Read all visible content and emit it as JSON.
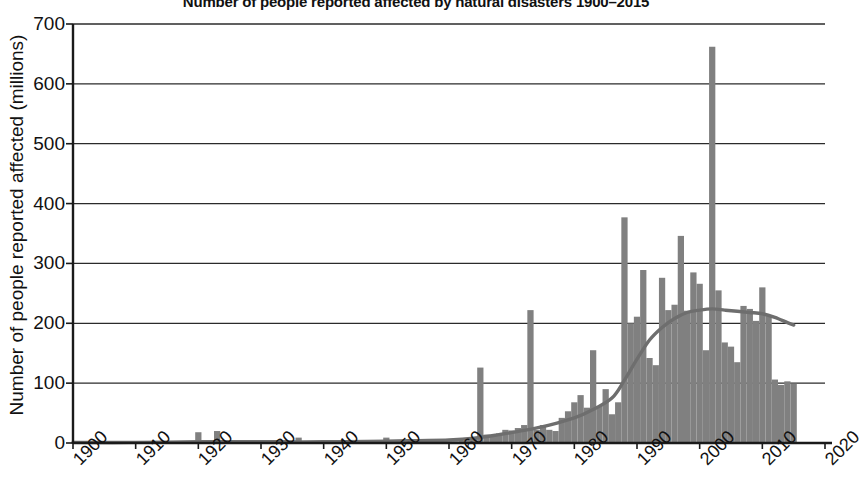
{
  "chart_data": {
    "type": "bar",
    "title": "Number of people reported affected by natural disasters 1900–2015",
    "xlabel": "",
    "ylabel": "Number of people reported affected (millions)",
    "xlim": [
      1900,
      2020
    ],
    "ylim": [
      0,
      700
    ],
    "ytick_labels": [
      "0",
      "100",
      "200",
      "300",
      "400",
      "500",
      "600",
      "700"
    ],
    "yticks": [
      0,
      100,
      200,
      300,
      400,
      500,
      600,
      700
    ],
    "xtick_labels": [
      "1900",
      "1910",
      "1920",
      "1930",
      "1940",
      "1950",
      "1960",
      "1970",
      "1980",
      "1990",
      "2000",
      "2010",
      "2020"
    ],
    "xticks": [
      1900,
      1910,
      1920,
      1930,
      1940,
      1950,
      1960,
      1970,
      1980,
      1990,
      2000,
      2010,
      2020
    ],
    "grid": "horizontal",
    "legend": "none",
    "bar_color": "#808080",
    "trend_color": "#6e6e6e",
    "axis_color": "#1a1a1a",
    "series": [
      {
        "name": "People reported affected (millions)",
        "type": "bar",
        "x": [
          1900,
          1901,
          1902,
          1903,
          1904,
          1905,
          1906,
          1907,
          1908,
          1909,
          1910,
          1911,
          1912,
          1913,
          1914,
          1915,
          1916,
          1917,
          1918,
          1919,
          1920,
          1921,
          1922,
          1923,
          1924,
          1925,
          1926,
          1927,
          1928,
          1929,
          1930,
          1931,
          1932,
          1933,
          1934,
          1935,
          1936,
          1937,
          1938,
          1939,
          1940,
          1941,
          1942,
          1943,
          1944,
          1945,
          1946,
          1947,
          1948,
          1949,
          1950,
          1951,
          1952,
          1953,
          1954,
          1955,
          1956,
          1957,
          1958,
          1959,
          1960,
          1961,
          1962,
          1963,
          1964,
          1965,
          1966,
          1967,
          1968,
          1969,
          1970,
          1971,
          1972,
          1973,
          1974,
          1975,
          1976,
          1977,
          1978,
          1979,
          1980,
          1981,
          1982,
          1983,
          1984,
          1985,
          1986,
          1987,
          1988,
          1989,
          1990,
          1991,
          1992,
          1993,
          1994,
          1995,
          1996,
          1997,
          1998,
          1999,
          2000,
          2001,
          2002,
          2003,
          2004,
          2005,
          2006,
          2007,
          2008,
          2009,
          2010,
          2011,
          2012,
          2013,
          2014,
          2015
        ],
        "values": [
          0,
          0,
          0,
          0,
          0,
          0,
          0,
          0,
          0,
          0,
          0,
          0,
          0,
          0,
          0,
          0,
          0,
          0,
          0,
          0,
          18,
          0,
          0,
          20,
          0,
          0,
          0,
          0,
          0,
          0,
          0,
          0,
          0,
          0,
          0,
          0,
          9,
          0,
          0,
          0,
          0,
          0,
          0,
          0,
          0,
          0,
          0,
          0,
          0,
          0,
          9,
          0,
          0,
          0,
          0,
          0,
          0,
          0,
          0,
          0,
          3,
          3,
          4,
          6,
          10,
          126,
          14,
          13,
          16,
          22,
          21,
          25,
          30,
          222,
          22,
          30,
          22,
          20,
          42,
          53,
          68,
          80,
          59,
          155,
          62,
          90,
          48,
          68,
          377,
          200,
          211,
          289,
          142,
          130,
          276,
          222,
          231,
          346,
          221,
          285,
          266,
          155,
          662,
          255,
          168,
          161,
          135,
          229,
          224,
          204,
          260,
          212,
          106,
          97,
          103,
          99
        ]
      },
      {
        "name": "Smoothed trend",
        "type": "line",
        "x": [
          1900,
          1910,
          1920,
          1930,
          1940,
          1950,
          1955,
          1960,
          1964,
          1968,
          1972,
          1976,
          1980,
          1983,
          1986,
          1988,
          1990,
          1992,
          1994,
          1996,
          1998,
          2000,
          2002,
          2004,
          2006,
          2008,
          2010,
          2012,
          2014,
          2015
        ],
        "values": [
          1,
          1,
          2,
          2,
          2,
          3,
          4,
          5,
          8,
          14,
          21,
          30,
          42,
          56,
          75,
          105,
          140,
          172,
          193,
          208,
          218,
          222,
          224,
          222,
          220,
          218,
          216,
          210,
          201,
          197
        ]
      }
    ]
  }
}
